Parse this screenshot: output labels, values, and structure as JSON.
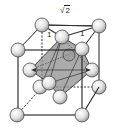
{
  "diagram": {
    "type": "crystal-unit-cell",
    "labels": {
      "diagonal": "2",
      "diagonal_radical": "√",
      "edge_left": "1",
      "edge_right": "1"
    },
    "colors": {
      "line": "#222222",
      "octahedron_fill": "#8a8a8a",
      "atom_fill_light": "#f4f4f4",
      "atom_fill_dark": "#9a9a9a",
      "background": "#ffffff"
    }
  }
}
